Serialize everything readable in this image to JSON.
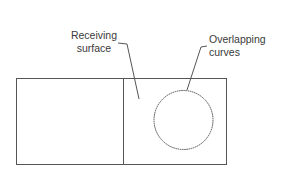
{
  "diagram": {
    "labels": {
      "receiving_surface_line1": "Receiving",
      "receiving_surface_line2": "surface",
      "overlapping_curves_line1": "Overlapping",
      "overlapping_curves_line2": "curves"
    },
    "colors": {
      "stroke": "#555555",
      "text": "#3a3a3a",
      "background": "#ffffff"
    }
  }
}
